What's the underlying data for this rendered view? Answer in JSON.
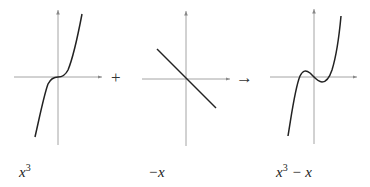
{
  "diagram": {
    "title": "",
    "panels": [
      {
        "id": "cube",
        "label_base": "x",
        "label_sup": "3",
        "label_rest": "",
        "function": "x^3"
      },
      {
        "id": "neg",
        "label_base": "−x",
        "label_sup": "",
        "label_rest": "",
        "function": "-x"
      },
      {
        "id": "sum",
        "label_base": "x",
        "label_sup": "3",
        "label_rest": " − x",
        "function": "x^3 - x"
      }
    ],
    "operators": {
      "plus": "+",
      "arrow": "→"
    },
    "colors": {
      "axis": "#9a9a9a",
      "curve": "#222222",
      "text": "#222222"
    }
  }
}
